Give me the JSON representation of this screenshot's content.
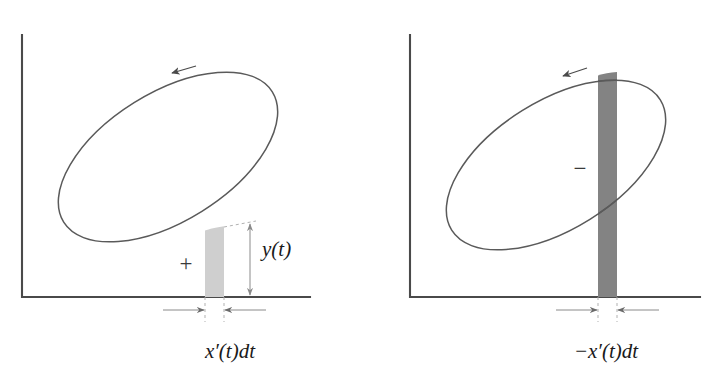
{
  "figure": {
    "background_color": "#ffffff",
    "ink_color": "#4a4a4a",
    "curve_color": "#5a5a5a"
  },
  "panels": [
    {
      "id": "left",
      "name": "positive-contribution-panel",
      "sign_label": "+",
      "sign_label_name": "plus-sign",
      "height_label": "y(t)",
      "height_label_parts": {
        "var": "y",
        "open": "(",
        "arg": "t",
        "close": ")"
      },
      "width_label": "x′(t)dt",
      "width_label_parts": {
        "lead": "",
        "var": "x",
        "prime": "′",
        "open": "(",
        "arg": "t",
        "close": ")",
        "diff": "dt"
      },
      "strip_fill": "#cfcfcf",
      "strip_tone": "light",
      "orientation_arrow": "counterclockwise-left",
      "axes": {
        "origin_x": 22,
        "origin_y": 297,
        "x_end": 310,
        "y_top": 35
      },
      "strip": {
        "x_left": 205,
        "x_right": 224,
        "y_top": 228,
        "y_bottom": 297
      },
      "ellipse": {
        "cx": 168,
        "cy": 157,
        "rx": 123,
        "ry": 64,
        "rotation_deg": -32
      }
    },
    {
      "id": "right",
      "name": "negative-contribution-panel",
      "sign_label": "−",
      "sign_label_name": "minus-sign",
      "height_label": "",
      "width_label": "−x′(t)dt",
      "width_label_parts": {
        "lead": "−",
        "var": "x",
        "prime": "′",
        "open": "(",
        "arg": "t",
        "close": ")",
        "diff": "dt"
      },
      "strip_fill": "#838383",
      "strip_tone": "dark",
      "orientation_arrow": "counterclockwise-left",
      "axes": {
        "origin_x": 410,
        "origin_y": 297,
        "x_end": 700,
        "y_top": 35
      },
      "strip": {
        "x_left": 598,
        "x_right": 617,
        "y_top": 72,
        "y_bottom": 297
      },
      "ellipse": {
        "cx": 556,
        "cy": 165,
        "rx": 123,
        "ry": 64,
        "rotation_deg": -32
      }
    }
  ],
  "annotations": {
    "left_width_dimension_name": "x-prime-dt-dimension",
    "right_width_dimension_name": "minus-x-prime-dt-dimension",
    "left_height_dimension_name": "y-of-t-dimension"
  }
}
